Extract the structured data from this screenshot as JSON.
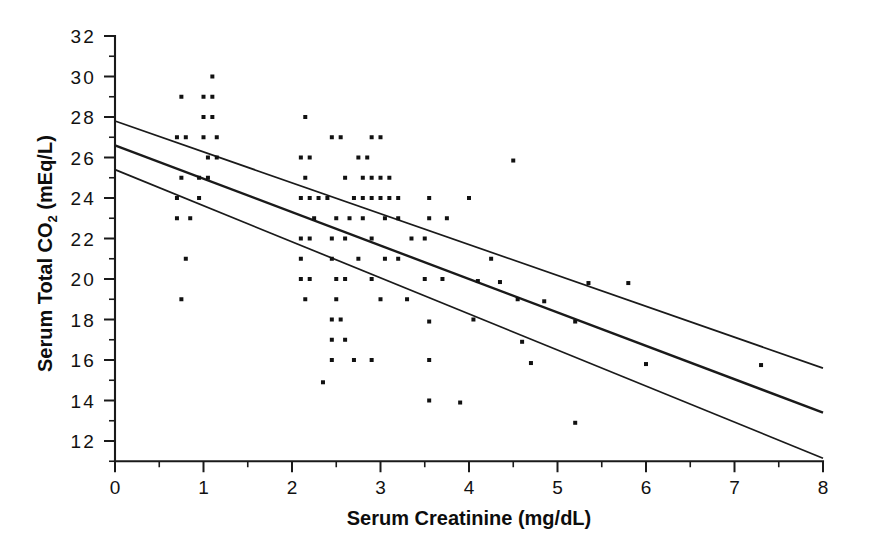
{
  "chart_data": {
    "type": "scatter",
    "title": "",
    "xlabel": "Serum Creatinine (mg/dL)",
    "ylabel_main": "Serum Total CO",
    "ylabel_sub": "2",
    "ylabel_units": "(mEq/L)",
    "xlim": [
      0,
      8
    ],
    "ylim": [
      11,
      32
    ],
    "grid": false,
    "legend": null,
    "x_ticks": [
      0,
      1,
      2,
      3,
      4,
      5,
      6,
      7,
      8
    ],
    "x_tick_labels": [
      "0",
      "1",
      "2",
      "3",
      "4",
      "5",
      "6",
      "7",
      "8"
    ],
    "x_minor_step": 0.5,
    "y_ticks": [
      12,
      14,
      16,
      18,
      20,
      22,
      24,
      26,
      28,
      30,
      32
    ],
    "y_tick_labels": [
      "12",
      "14",
      "16",
      "18",
      "20",
      "22",
      "24",
      "26",
      "28",
      "30",
      "32"
    ],
    "y_minor_step": 1,
    "point_marker": "square",
    "point_size_px": 4,
    "series": [
      {
        "name": "observations",
        "points": [
          [
            1.1,
            30.0
          ],
          [
            0.75,
            29.0
          ],
          [
            1.0,
            29.0
          ],
          [
            1.1,
            29.0
          ],
          [
            1.0,
            28.0
          ],
          [
            1.1,
            28.0
          ],
          [
            2.15,
            28.0
          ],
          [
            0.7,
            27.0
          ],
          [
            0.8,
            27.0
          ],
          [
            1.0,
            27.0
          ],
          [
            1.15,
            27.0
          ],
          [
            2.45,
            27.0
          ],
          [
            2.55,
            27.0
          ],
          [
            2.9,
            27.0
          ],
          [
            3.0,
            27.0
          ],
          [
            1.05,
            26.0
          ],
          [
            1.15,
            26.0
          ],
          [
            2.1,
            26.0
          ],
          [
            2.2,
            26.0
          ],
          [
            2.75,
            26.0
          ],
          [
            2.85,
            26.0
          ],
          [
            0.75,
            25.0
          ],
          [
            0.95,
            25.0
          ],
          [
            1.05,
            25.0
          ],
          [
            2.15,
            25.0
          ],
          [
            2.6,
            25.0
          ],
          [
            2.8,
            25.0
          ],
          [
            2.9,
            25.0
          ],
          [
            3.0,
            25.0
          ],
          [
            3.1,
            25.0
          ],
          [
            4.5,
            25.85
          ],
          [
            0.7,
            24.0
          ],
          [
            0.95,
            24.0
          ],
          [
            2.1,
            24.0
          ],
          [
            2.2,
            24.0
          ],
          [
            2.3,
            24.0
          ],
          [
            2.4,
            24.0
          ],
          [
            2.7,
            24.0
          ],
          [
            2.8,
            24.0
          ],
          [
            2.9,
            24.0
          ],
          [
            3.0,
            24.0
          ],
          [
            3.1,
            24.0
          ],
          [
            3.2,
            24.0
          ],
          [
            3.55,
            24.0
          ],
          [
            4.0,
            24.0
          ],
          [
            0.7,
            23.0
          ],
          [
            0.85,
            23.0
          ],
          [
            2.25,
            23.0
          ],
          [
            2.5,
            23.0
          ],
          [
            2.65,
            23.0
          ],
          [
            2.8,
            23.0
          ],
          [
            3.05,
            23.0
          ],
          [
            3.2,
            23.0
          ],
          [
            3.55,
            23.0
          ],
          [
            3.75,
            23.0
          ],
          [
            2.1,
            22.0
          ],
          [
            2.2,
            22.0
          ],
          [
            2.45,
            22.0
          ],
          [
            2.6,
            22.0
          ],
          [
            2.9,
            22.0
          ],
          [
            3.35,
            22.0
          ],
          [
            3.5,
            22.0
          ],
          [
            0.8,
            21.0
          ],
          [
            2.1,
            21.0
          ],
          [
            2.45,
            21.0
          ],
          [
            2.75,
            21.0
          ],
          [
            3.05,
            21.0
          ],
          [
            3.2,
            21.0
          ],
          [
            4.25,
            21.0
          ],
          [
            2.1,
            20.0
          ],
          [
            2.2,
            20.0
          ],
          [
            2.5,
            20.0
          ],
          [
            2.6,
            20.0
          ],
          [
            2.9,
            20.0
          ],
          [
            3.5,
            20.0
          ],
          [
            3.7,
            20.0
          ],
          [
            4.1,
            19.9
          ],
          [
            4.35,
            19.85
          ],
          [
            5.35,
            19.8
          ],
          [
            5.8,
            19.8
          ],
          [
            0.75,
            19.0
          ],
          [
            2.15,
            19.0
          ],
          [
            2.5,
            19.0
          ],
          [
            3.0,
            19.0
          ],
          [
            3.3,
            19.0
          ],
          [
            4.55,
            19.0
          ],
          [
            4.85,
            18.9
          ],
          [
            2.45,
            18.0
          ],
          [
            2.55,
            18.0
          ],
          [
            3.55,
            17.9
          ],
          [
            4.05,
            18.0
          ],
          [
            5.2,
            17.9
          ],
          [
            2.45,
            17.0
          ],
          [
            2.6,
            17.0
          ],
          [
            4.6,
            16.9
          ],
          [
            2.45,
            16.0
          ],
          [
            2.7,
            16.0
          ],
          [
            2.9,
            16.0
          ],
          [
            3.55,
            16.0
          ],
          [
            4.7,
            15.85
          ],
          [
            6.0,
            15.8
          ],
          [
            7.3,
            15.75
          ],
          [
            2.35,
            14.9
          ],
          [
            3.55,
            14.0
          ],
          [
            3.9,
            13.9
          ],
          [
            5.2,
            12.9
          ]
        ]
      }
    ],
    "fit_lines": [
      {
        "name": "upper-confidence-band",
        "x0": 0,
        "y0": 27.8,
        "x1": 8,
        "y1": 15.6,
        "style": "bound"
      },
      {
        "name": "regression-line",
        "x0": 0,
        "y0": 26.6,
        "x1": 8,
        "y1": 13.4,
        "style": "main"
      },
      {
        "name": "lower-confidence-band",
        "x0": 0,
        "y0": 25.4,
        "x1": 8,
        "y1": 11.15,
        "style": "bound"
      }
    ]
  }
}
